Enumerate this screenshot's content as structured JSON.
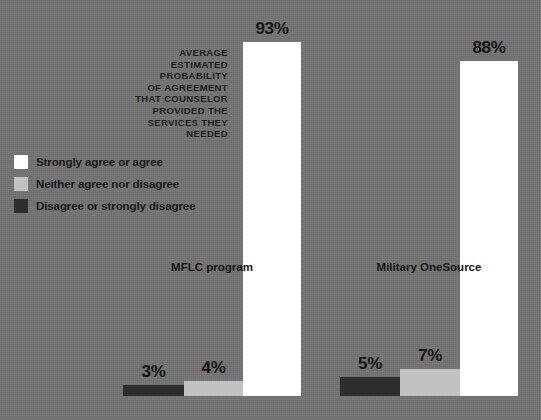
{
  "chart_data": {
    "type": "bar",
    "title": "AVERAGE ESTIMATED PROBABILITY OF AGREEMENT THAT COUNSELOR PROVIDED THE SERVICES THEY NEEDED",
    "xlabel": "",
    "ylabel": "",
    "ylim": [
      0,
      100
    ],
    "grid": false,
    "legend_position": "upper-left",
    "categories": [
      "MFLC program",
      "Military OneSource"
    ],
    "series": [
      {
        "name": "Disagree or strongly disagree",
        "color": "#2e2e2e",
        "values": [
          3,
          5
        ],
        "labels": [
          "3%",
          "5%"
        ]
      },
      {
        "name": "Neither agree nor disagree",
        "color": "#c2c2c2",
        "values": [
          4,
          7
        ],
        "labels": [
          "4%",
          "7%"
        ]
      },
      {
        "name": "Strongly agree or agree",
        "color": "#ffffff",
        "values": [
          93,
          88
        ],
        "labels": [
          "93%",
          "88%"
        ]
      }
    ]
  },
  "axis_title_text": "AVERAGE\nESTIMATED\nPROBABILITY\nOF AGREEMENT\nTHAT COUNSELOR\nPROVIDED THE\nSERVICES THEY\nNEEDED",
  "legend": {
    "items": [
      {
        "label": "Strongly agree or agree",
        "color": "#ffffff"
      },
      {
        "label": "Neither agree nor disagree",
        "color": "#c2c2c2"
      },
      {
        "label": "Disagree or strongly disagree",
        "color": "#2e2e2e"
      }
    ]
  },
  "categories": [
    {
      "label": "MFLC program"
    },
    {
      "label": "Military OneSource"
    }
  ],
  "bars": [
    {
      "label": "3%",
      "value": 3,
      "color": "#2e2e2e",
      "x": 123,
      "width": 61
    },
    {
      "label": "4%",
      "value": 4,
      "color": "#c2c2c2",
      "x": 184,
      "width": 59
    },
    {
      "label": "93%",
      "value": 93,
      "color": "#ffffff",
      "x": 243,
      "width": 58
    },
    {
      "label": "5%",
      "value": 5,
      "color": "#2e2e2e",
      "x": 340,
      "width": 60
    },
    {
      "label": "7%",
      "value": 7,
      "color": "#c2c2c2",
      "x": 400,
      "width": 60
    },
    {
      "label": "88%",
      "value": 88,
      "color": "#ffffff",
      "x": 460,
      "width": 58
    }
  ],
  "colors": {
    "background": "#727272",
    "text": "#141414",
    "agree": "#ffffff",
    "neither": "#c2c2c2",
    "disagree": "#2e2e2e"
  }
}
